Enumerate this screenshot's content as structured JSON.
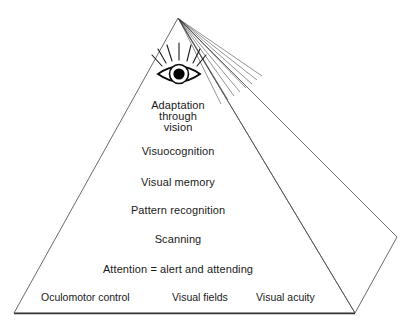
{
  "diagram": {
    "type": "pyramid-hierarchy",
    "shape": "three-dimensional triangular pyramid with visible right side face",
    "colors": {
      "background": "#ffffff",
      "outline": "#555555",
      "base_line": "#333333",
      "text": "#1a1a1a",
      "eye_fill": "#000000"
    },
    "apex_icon": {
      "name": "eye-icon",
      "description": "open eye with concentric iris and solid pupil, radiating eyelash rays above",
      "ray_count": 7,
      "fan_line_count": 8
    },
    "tiers": [
      {
        "id": "adaptation",
        "level": 1,
        "lines": [
          "Adaptation",
          "through",
          "vision"
        ]
      },
      {
        "id": "visuocognition",
        "level": 2,
        "label": "Visuocognition"
      },
      {
        "id": "visual-memory",
        "level": 3,
        "label": "Visual memory"
      },
      {
        "id": "pattern-recognition",
        "level": 4,
        "label": "Pattern recognition"
      },
      {
        "id": "scanning",
        "level": 5,
        "label": "Scanning"
      },
      {
        "id": "attention",
        "level": 6,
        "label": "Attention = alert and attending"
      }
    ],
    "base_tier": {
      "level": 7,
      "items": [
        {
          "id": "oculomotor-control",
          "label": "Oculomotor control"
        },
        {
          "id": "visual-fields",
          "label": "Visual fields"
        },
        {
          "id": "visual-acuity",
          "label": "Visual acuity"
        }
      ]
    }
  }
}
